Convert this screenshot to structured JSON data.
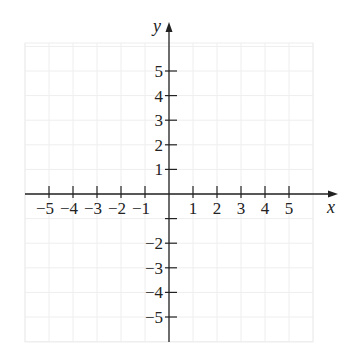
{
  "chart_data": {
    "type": "scatter",
    "title": "",
    "xlabel": "x",
    "ylabel": "y",
    "xlim": [
      -6,
      6
    ],
    "ylim": [
      -6,
      6
    ],
    "grid": true,
    "x_ticks": [
      -5,
      -4,
      -3,
      -2,
      -1,
      1,
      2,
      3,
      4,
      5
    ],
    "x_tick_labels": [
      "−5",
      "−4",
      "−3",
      "−2",
      "−1",
      "1",
      "2",
      "3",
      "4",
      "5"
    ],
    "y_ticks": [
      5,
      4,
      3,
      2,
      1,
      -1,
      -2,
      -3,
      -4,
      -5
    ],
    "y_tick_labels": [
      "5",
      "4",
      "3",
      "2",
      "1",
      "",
      "−2",
      "−3",
      "−4",
      "−5"
    ],
    "series": [],
    "legend": null
  },
  "colors": {
    "axis": "#222222",
    "grid": "#eeeeee",
    "background": "#ffffff"
  }
}
